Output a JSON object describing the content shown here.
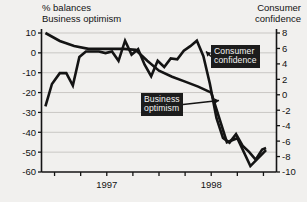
{
  "header": {
    "left_title_line1": "% balances",
    "left_title_line2": "Business optimism",
    "right_title_line1": "Consumer",
    "right_title_line2": "confidence"
  },
  "callouts": {
    "consumer": "Consumer\nconfidence",
    "business": "Business\noptimism"
  },
  "chart_data": {
    "type": "line",
    "title": "",
    "subtitle": "",
    "xlabel": "",
    "ylabel": "% balances",
    "grid": true,
    "legend_position": "inline-callouts",
    "x_tick_labels": [
      "1997",
      "1998"
    ],
    "x_tick_label_positions": [
      5,
      13
    ],
    "x_minor_ticks": [
      1,
      3,
      5,
      7,
      9,
      11,
      13,
      15,
      17
    ],
    "x_range": [
      0,
      18
    ],
    "left_axis": {
      "name": "Business optimism",
      "unit": "% balances",
      "ylim": [
        -60,
        10
      ],
      "ticks": [
        10,
        0,
        -10,
        -20,
        -30,
        -40,
        -50,
        -60
      ]
    },
    "right_axis": {
      "name": "Consumer confidence",
      "ylim": [
        -10,
        8
      ],
      "ticks": [
        8,
        6,
        4,
        2,
        0,
        -2,
        -4,
        -6,
        -8,
        -10
      ]
    },
    "series": [
      {
        "name": "Business optimism",
        "axis": "left",
        "color": "#141414",
        "x": [
          0.3,
          1.4,
          2.5,
          3.6,
          4.5,
          5.4,
          6.3,
          7.2,
          8.1,
          9.0,
          10.0,
          11.0,
          12.0,
          13.0,
          14.2,
          15.0,
          16.0,
          17.2
        ],
        "values": [
          10,
          6,
          3.5,
          2,
          2,
          2,
          2,
          1.5,
          -4,
          -9,
          -12,
          -14.5,
          -17,
          -20,
          -45,
          -43,
          -57,
          -49
        ]
      },
      {
        "name": "Consumer confidence",
        "axis": "right",
        "color": "#141414",
        "x": [
          0.3,
          0.8,
          1.4,
          1.9,
          2.4,
          2.9,
          3.4,
          3.9,
          4.4,
          4.9,
          5.4,
          5.9,
          6.4,
          6.9,
          7.4,
          7.9,
          8.4,
          8.9,
          9.4,
          9.9,
          10.4,
          10.9,
          11.4,
          11.9,
          12.4,
          12.9,
          13.4,
          13.9,
          14.4,
          14.9,
          15.4,
          15.9,
          16.4,
          16.9,
          17.2
        ],
        "values": [
          -1.5,
          1.4,
          2.8,
          2.8,
          1.2,
          4.9,
          5.6,
          5.6,
          5.6,
          5.4,
          5.6,
          4.4,
          7.0,
          5.2,
          5.9,
          3.9,
          2.4,
          4.4,
          3.6,
          4.7,
          4.6,
          5.7,
          6.3,
          7.0,
          5.0,
          1.4,
          -3.0,
          -5.6,
          -6.2,
          -5.1,
          -6.6,
          -7.4,
          -8.4,
          -7.1,
          -6.9
        ]
      }
    ],
    "annotations": [
      {
        "text": "Consumer confidence",
        "target_x": 12.6,
        "target_value": 5.6,
        "axis": "right"
      },
      {
        "text": "Business optimism",
        "target_x": 13.6,
        "target_value": -24,
        "axis": "left"
      }
    ]
  }
}
